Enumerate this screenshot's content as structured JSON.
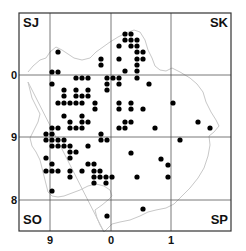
{
  "map": {
    "frame": {
      "x1": 19,
      "y1": 13,
      "x2": 231,
      "y2": 231
    },
    "vertical_gridlines": [
      50,
      111,
      171
    ],
    "horizontal_gridlines": [
      75,
      137,
      200
    ],
    "square_labels": [
      {
        "text": "SJ",
        "x": 23,
        "y": 27,
        "anchor": "start"
      },
      {
        "text": "SK",
        "x": 228,
        "y": 27,
        "anchor": "end"
      },
      {
        "text": "SO",
        "x": 23,
        "y": 224,
        "anchor": "start"
      },
      {
        "text": "SP",
        "x": 228,
        "y": 224,
        "anchor": "end"
      }
    ],
    "y_axis_labels": [
      {
        "text": "0",
        "y": 79
      },
      {
        "text": "9",
        "y": 141
      },
      {
        "text": "8",
        "y": 204
      }
    ],
    "x_axis_labels": [
      {
        "text": "9",
        "x": 50
      },
      {
        "text": "0",
        "x": 111
      },
      {
        "text": "1",
        "x": 171
      }
    ],
    "colors": {
      "frame": "#333333",
      "grid": "#555555",
      "outline": "#c8c8c8",
      "dot": "#000000"
    },
    "dots": [
      [
        125,
        34
      ],
      [
        131,
        34
      ],
      [
        125,
        40
      ],
      [
        131,
        40
      ],
      [
        137,
        40
      ],
      [
        119,
        46
      ],
      [
        131,
        46
      ],
      [
        137,
        46
      ],
      [
        58,
        52
      ],
      [
        137,
        52
      ],
      [
        143,
        52
      ],
      [
        101,
        59
      ],
      [
        119,
        59
      ],
      [
        137,
        59
      ],
      [
        143,
        59
      ],
      [
        101,
        65
      ],
      [
        137,
        65
      ],
      [
        52,
        72
      ],
      [
        58,
        72
      ],
      [
        125,
        71
      ],
      [
        137,
        71
      ],
      [
        76,
        78
      ],
      [
        82,
        78
      ],
      [
        88,
        78
      ],
      [
        107,
        78
      ],
      [
        113,
        78
      ],
      [
        119,
        78
      ],
      [
        137,
        78
      ],
      [
        52,
        84
      ],
      [
        107,
        84
      ],
      [
        119,
        84
      ],
      [
        149,
        84
      ],
      [
        64,
        90
      ],
      [
        76,
        90
      ],
      [
        88,
        90
      ],
      [
        107,
        90
      ],
      [
        64,
        96
      ],
      [
        76,
        96
      ],
      [
        82,
        96
      ],
      [
        88,
        96
      ],
      [
        58,
        103
      ],
      [
        64,
        103
      ],
      [
        70,
        103
      ],
      [
        76,
        103
      ],
      [
        82,
        103
      ],
      [
        95,
        103
      ],
      [
        119,
        103
      ],
      [
        131,
        103
      ],
      [
        173,
        103
      ],
      [
        95,
        109
      ],
      [
        119,
        109
      ],
      [
        131,
        109
      ],
      [
        143,
        109
      ],
      [
        64,
        116
      ],
      [
        82,
        116
      ],
      [
        70,
        122
      ],
      [
        82,
        122
      ],
      [
        88,
        122
      ],
      [
        125,
        122
      ],
      [
        131,
        122
      ],
      [
        198,
        122
      ],
      [
        52,
        128
      ],
      [
        58,
        128
      ],
      [
        70,
        128
      ],
      [
        76,
        128
      ],
      [
        82,
        128
      ],
      [
        119,
        128
      ],
      [
        125,
        128
      ],
      [
        155,
        128
      ],
      [
        210,
        128
      ],
      [
        46,
        134
      ],
      [
        52,
        134
      ],
      [
        101,
        134
      ],
      [
        46,
        140
      ],
      [
        52,
        140
      ],
      [
        58,
        140
      ],
      [
        64,
        140
      ],
      [
        101,
        140
      ],
      [
        107,
        140
      ],
      [
        180,
        140
      ],
      [
        52,
        146
      ],
      [
        58,
        146
      ],
      [
        64,
        146
      ],
      [
        70,
        146
      ],
      [
        88,
        146
      ],
      [
        70,
        152
      ],
      [
        76,
        152
      ],
      [
        131,
        153
      ],
      [
        46,
        158
      ],
      [
        70,
        158
      ],
      [
        161,
        159
      ],
      [
        52,
        164
      ],
      [
        88,
        164
      ],
      [
        94,
        164
      ],
      [
        168,
        165
      ],
      [
        46,
        171
      ],
      [
        52,
        171
      ],
      [
        58,
        171
      ],
      [
        70,
        171
      ],
      [
        82,
        171
      ],
      [
        94,
        171
      ],
      [
        100,
        171
      ],
      [
        70,
        177
      ],
      [
        94,
        177
      ],
      [
        100,
        177
      ],
      [
        106,
        177
      ],
      [
        112,
        177
      ],
      [
        137,
        177
      ],
      [
        168,
        177
      ],
      [
        94,
        183
      ],
      [
        106,
        183
      ],
      [
        52,
        191
      ],
      [
        143,
        209
      ],
      [
        107,
        216
      ]
    ],
    "outline_path": "M28,72 L33,66 L40,60 L46,58 L50,52 L56,47 L62,50 L68,54 L74,58 L82,60 L90,58 L96,52 L103,47 L110,42 L118,37 L126,33 L134,30 L140,32 L145,40 L148,50 L152,58 L155,66 L160,70 L166,71 L172,68 L180,72 L190,78 L197,84 L203,92 L206,102 L211,112 L216,120 L219,126 L214,132 L209,136 L210,145 L208,156 L204,168 L198,178 L190,188 L182,196 L174,204 L166,208 L156,210 L148,212 L140,216 L130,220 L120,222 L112,224 L108,228 L104,232 M104,232 L100,225 L97,218 L95,210 L102,205 L108,200 L112,196 L110,190 L104,186 L96,184 L88,186 L80,190 L72,193 L64,196 L58,197 L52,196 L48,192 L46,184 L44,176 L42,168 L40,160 L36,152 L32,146 L30,138 L34,130 L38,122 L40,114 L36,106 L32,98 L30,90 L28,82 Z"
  }
}
